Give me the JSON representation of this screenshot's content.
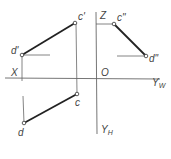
{
  "diagram": {
    "type": "orthographic-projection",
    "colors": {
      "line": "#555555",
      "segment": "#222222",
      "background": "#ffffff"
    },
    "axes": {
      "x_label": "X",
      "z_label": "Z",
      "origin_label": "O",
      "yw_label": "Y",
      "yw_sub": "W",
      "yh_label": "Y",
      "yh_sub": "H"
    },
    "points": {
      "d_front": {
        "label": "d'",
        "x": 22,
        "y": 55
      },
      "c_front": {
        "label": "c'",
        "x": 75,
        "y": 23
      },
      "c_side": {
        "label": "c\"",
        "x": 114,
        "y": 24
      },
      "d_side": {
        "label": "d\"",
        "x": 146,
        "y": 56
      },
      "c_top": {
        "label": "c",
        "x": 77,
        "y": 94
      },
      "d_top": {
        "label": "d",
        "x": 24,
        "y": 123
      }
    }
  }
}
